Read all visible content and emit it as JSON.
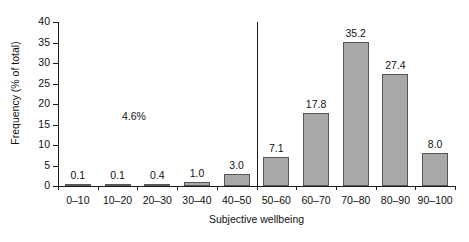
{
  "chart_data": {
    "type": "bar",
    "title": "",
    "xlabel": "Subjective wellbeing",
    "ylabel": "Frequency (% of total)",
    "categories": [
      "0–10",
      "10–20",
      "20–30",
      "30–40",
      "40–50",
      "50–60",
      "60–70",
      "70–80",
      "80–90",
      "90–100"
    ],
    "values": [
      0.1,
      0.1,
      0.4,
      1.0,
      3.0,
      7.1,
      17.8,
      35.2,
      27.4,
      8.0
    ],
    "value_labels": [
      "0.1",
      "0.1",
      "0.4",
      "1.0",
      "3.0",
      "7.1",
      "17.8",
      "35.2",
      "27.4",
      "8.0"
    ],
    "ylim": [
      0,
      40
    ],
    "yticks": [
      0,
      5,
      10,
      15,
      20,
      25,
      30,
      35,
      40
    ],
    "ytick_labels": [
      "0",
      "5",
      "10",
      "15",
      "20",
      "25",
      "30",
      "35",
      "40"
    ],
    "grid": false,
    "legend": null,
    "annotations": [
      {
        "text": "4.6%",
        "name": "low-wellbeing-share-annotation"
      }
    ],
    "reference_line": {
      "name": "midpoint-divider",
      "between_categories": [
        "40–50",
        "50–60"
      ]
    },
    "colors": {
      "bar_fill": "#a9a9a9",
      "bar_border": "#575757",
      "axis": "#1a1a1a",
      "text": "#111111",
      "background": "#ffffff"
    }
  }
}
